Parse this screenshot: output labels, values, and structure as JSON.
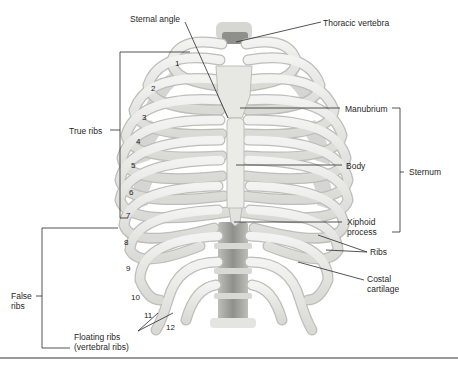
{
  "figure": {
    "labels": {
      "sternal_angle": "Sternal angle",
      "thoracic_vertebra": "Thoracic vertebra",
      "manubrium": "Manubrium",
      "body": "Body",
      "sternum": "Sternum",
      "xiphoid_line1": "Xiphoid",
      "xiphoid_line2": "process",
      "ribs": "Ribs",
      "costal_line1": "Costal",
      "costal_line2": "cartilage",
      "true_ribs": "True ribs",
      "false_line1": "False",
      "false_line2": "ribs",
      "floating_line1": "Floating ribs",
      "floating_line2": "(vertebral ribs)"
    },
    "rib_numbers": [
      "1",
      "2",
      "3",
      "4",
      "5",
      "6",
      "7",
      "8",
      "9",
      "10",
      "11",
      "12"
    ],
    "colors": {
      "bone": "#ececea",
      "bone_shade": "#cfcfcc",
      "bone_outline": "#b8b8b5",
      "vertebra": "#9e9e9a",
      "leader": "#2a2a2a",
      "rule": "#9a9a9a"
    }
  }
}
